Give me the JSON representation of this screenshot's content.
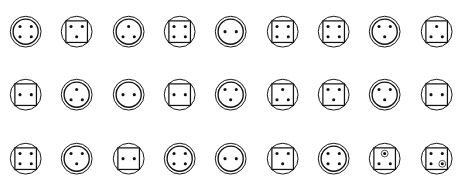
{
  "figure": {
    "rows": 3,
    "columns": 9,
    "stroke_color": "#111111",
    "dot_color": "#111111",
    "background_color": "#ffffff"
  },
  "glyphs": [
    {
      "id": "r1c1",
      "row": 1,
      "col": 1,
      "frame": "double-circle",
      "dot_count": 4,
      "dot_layout": "four-corners",
      "dots": [
        {
          "x": -1,
          "y": -1,
          "ringed": false
        },
        {
          "x": 1,
          "y": -1,
          "ringed": false
        },
        {
          "x": -1,
          "y": 1,
          "ringed": false
        },
        {
          "x": 1,
          "y": 1,
          "ringed": false
        }
      ]
    },
    {
      "id": "r1c2",
      "row": 1,
      "col": 2,
      "frame": "circle-square",
      "dot_count": 3,
      "dot_layout": "two-top-one-bottom-center",
      "dots": [
        {
          "x": -1,
          "y": -1,
          "ringed": false
        },
        {
          "x": 1,
          "y": -1,
          "ringed": false
        },
        {
          "x": 0,
          "y": 1,
          "ringed": false
        }
      ]
    },
    {
      "id": "r1c3",
      "row": 1,
      "col": 3,
      "frame": "double-circle",
      "dot_count": 3,
      "dot_layout": "one-top-center-two-bottom",
      "dots": [
        {
          "x": 0,
          "y": -1,
          "ringed": false
        },
        {
          "x": -1,
          "y": 1,
          "ringed": false
        },
        {
          "x": 1,
          "y": 1,
          "ringed": false
        }
      ]
    },
    {
      "id": "r1c4",
      "row": 1,
      "col": 4,
      "frame": "circle-square",
      "dot_count": 4,
      "dot_layout": "four-corners",
      "dots": [
        {
          "x": -1,
          "y": -1,
          "ringed": false
        },
        {
          "x": 1,
          "y": -1,
          "ringed": false
        },
        {
          "x": -1,
          "y": 1,
          "ringed": false
        },
        {
          "x": 1,
          "y": 1,
          "ringed": false
        }
      ]
    },
    {
      "id": "r1c5",
      "row": 1,
      "col": 5,
      "frame": "double-circle",
      "dot_count": 2,
      "dot_layout": "two-horizontal-center",
      "dots": [
        {
          "x": -1,
          "y": 0,
          "ringed": false
        },
        {
          "x": 1,
          "y": 0,
          "ringed": false
        }
      ]
    },
    {
      "id": "r1c6",
      "row": 1,
      "col": 6,
      "frame": "circle-square",
      "dot_count": 4,
      "dot_layout": "four-corners",
      "dots": [
        {
          "x": -1,
          "y": -1,
          "ringed": false
        },
        {
          "x": 1,
          "y": -1,
          "ringed": false
        },
        {
          "x": -1,
          "y": 1,
          "ringed": false
        },
        {
          "x": 1,
          "y": 1,
          "ringed": false
        }
      ]
    },
    {
      "id": "r1c7",
      "row": 1,
      "col": 7,
      "frame": "circle-square",
      "dot_count": 4,
      "dot_layout": "four-corners",
      "dots": [
        {
          "x": -1,
          "y": -1,
          "ringed": false
        },
        {
          "x": 1,
          "y": -1,
          "ringed": false
        },
        {
          "x": -1,
          "y": 1,
          "ringed": false
        },
        {
          "x": 1,
          "y": 1,
          "ringed": false
        }
      ]
    },
    {
      "id": "r1c8",
      "row": 1,
      "col": 8,
      "frame": "double-circle",
      "dot_count": 3,
      "dot_layout": "two-top-one-bottom-center",
      "dots": [
        {
          "x": -1,
          "y": -1,
          "ringed": false
        },
        {
          "x": 1,
          "y": -1,
          "ringed": false
        },
        {
          "x": 0,
          "y": 1,
          "ringed": false
        }
      ]
    },
    {
      "id": "r1c9",
      "row": 1,
      "col": 9,
      "frame": "circle-square",
      "dot_count": 3,
      "dot_layout": "one-top-center-two-bottom",
      "dots": [
        {
          "x": 0,
          "y": -1,
          "ringed": false
        },
        {
          "x": -1,
          "y": 1,
          "ringed": false
        },
        {
          "x": 1,
          "y": 1,
          "ringed": false
        }
      ]
    },
    {
      "id": "r2c1",
      "row": 2,
      "col": 1,
      "frame": "circle-square",
      "dot_count": 2,
      "dot_layout": "two-horizontal-center",
      "dots": [
        {
          "x": -1,
          "y": 0,
          "ringed": false
        },
        {
          "x": 1,
          "y": 0,
          "ringed": false
        }
      ]
    },
    {
      "id": "r2c2",
      "row": 2,
      "col": 2,
      "frame": "double-circle",
      "dot_count": 3,
      "dot_layout": "one-top-center-two-bottom",
      "dots": [
        {
          "x": 0,
          "y": -1,
          "ringed": false
        },
        {
          "x": -1,
          "y": 1,
          "ringed": false
        },
        {
          "x": 1,
          "y": 1,
          "ringed": false
        }
      ]
    },
    {
      "id": "r2c3",
      "row": 2,
      "col": 3,
      "frame": "double-circle",
      "dot_count": 2,
      "dot_layout": "two-horizontal-center",
      "dots": [
        {
          "x": -1,
          "y": 0,
          "ringed": false
        },
        {
          "x": 1,
          "y": 0,
          "ringed": false
        }
      ]
    },
    {
      "id": "r2c4",
      "row": 2,
      "col": 4,
      "frame": "circle-square",
      "dot_count": 2,
      "dot_layout": "two-horizontal-center",
      "dots": [
        {
          "x": -1,
          "y": 0,
          "ringed": false
        },
        {
          "x": 1,
          "y": 0,
          "ringed": false
        }
      ]
    },
    {
      "id": "r2c5",
      "row": 2,
      "col": 5,
      "frame": "double-circle",
      "dot_count": 3,
      "dot_layout": "two-top-one-bottom-center",
      "dots": [
        {
          "x": -1,
          "y": -1,
          "ringed": false
        },
        {
          "x": 1,
          "y": -1,
          "ringed": false
        },
        {
          "x": 0,
          "y": 1,
          "ringed": false
        }
      ]
    },
    {
      "id": "r2c6",
      "row": 2,
      "col": 6,
      "frame": "circle-square",
      "dot_count": 3,
      "dot_layout": "one-top-center-two-bottom",
      "dots": [
        {
          "x": 0,
          "y": -1,
          "ringed": false
        },
        {
          "x": -1,
          "y": 1,
          "ringed": false
        },
        {
          "x": 1,
          "y": 1,
          "ringed": false
        }
      ]
    },
    {
      "id": "r2c7",
      "row": 2,
      "col": 7,
      "frame": "circle-square",
      "dot_count": 3,
      "dot_layout": "two-top-one-bottom-center",
      "dots": [
        {
          "x": -1,
          "y": -1,
          "ringed": false
        },
        {
          "x": 1,
          "y": -1,
          "ringed": false
        },
        {
          "x": 0,
          "y": 1,
          "ringed": false
        }
      ]
    },
    {
      "id": "r2c8",
      "row": 2,
      "col": 8,
      "frame": "double-circle",
      "dot_count": 3,
      "dot_layout": "two-top-one-bottom-center",
      "dots": [
        {
          "x": -1,
          "y": -1,
          "ringed": false
        },
        {
          "x": 1,
          "y": -1,
          "ringed": false
        },
        {
          "x": 0,
          "y": 1,
          "ringed": false
        }
      ]
    },
    {
      "id": "r2c9",
      "row": 2,
      "col": 9,
      "frame": "circle-square",
      "dot_count": 2,
      "dot_layout": "two-horizontal-center",
      "dots": [
        {
          "x": -1,
          "y": 0,
          "ringed": false
        },
        {
          "x": 1,
          "y": 0,
          "ringed": false
        }
      ]
    },
    {
      "id": "r3c1",
      "row": 3,
      "col": 1,
      "frame": "circle-square",
      "dot_count": 4,
      "dot_layout": "four-corners",
      "dots": [
        {
          "x": -1,
          "y": -1,
          "ringed": false
        },
        {
          "x": 1,
          "y": -1,
          "ringed": false
        },
        {
          "x": -1,
          "y": 1,
          "ringed": false
        },
        {
          "x": 1,
          "y": 1,
          "ringed": false
        }
      ]
    },
    {
      "id": "r3c2",
      "row": 3,
      "col": 2,
      "frame": "double-circle",
      "dot_count": 3,
      "dot_layout": "two-top-one-bottom-center",
      "dots": [
        {
          "x": -1,
          "y": -1,
          "ringed": false
        },
        {
          "x": 1,
          "y": -1,
          "ringed": false
        },
        {
          "x": 0,
          "y": 1,
          "ringed": false
        }
      ]
    },
    {
      "id": "r3c3",
      "row": 3,
      "col": 3,
      "frame": "circle-square",
      "dot_count": 2,
      "dot_layout": "two-horizontal-center",
      "dots": [
        {
          "x": -1,
          "y": 0,
          "ringed": false
        },
        {
          "x": 1,
          "y": 0,
          "ringed": false
        }
      ]
    },
    {
      "id": "r3c4",
      "row": 3,
      "col": 4,
      "frame": "double-circle",
      "dot_count": 4,
      "dot_layout": "four-corners",
      "dots": [
        {
          "x": -1,
          "y": -1,
          "ringed": false
        },
        {
          "x": 1,
          "y": -1,
          "ringed": false
        },
        {
          "x": -1,
          "y": 1,
          "ringed": false
        },
        {
          "x": 1,
          "y": 1,
          "ringed": false
        }
      ]
    },
    {
      "id": "r3c5",
      "row": 3,
      "col": 5,
      "frame": "double-circle",
      "dot_count": 2,
      "dot_layout": "two-horizontal-center",
      "dots": [
        {
          "x": -1,
          "y": 0,
          "ringed": false
        },
        {
          "x": 1,
          "y": 0,
          "ringed": false
        }
      ]
    },
    {
      "id": "r3c6",
      "row": 3,
      "col": 6,
      "frame": "circle-square",
      "dot_count": 3,
      "dot_layout": "two-top-one-bottom-center",
      "dots": [
        {
          "x": -1,
          "y": -1,
          "ringed": false
        },
        {
          "x": 1,
          "y": -1,
          "ringed": false
        },
        {
          "x": 0,
          "y": 1,
          "ringed": false
        }
      ]
    },
    {
      "id": "r3c7",
      "row": 3,
      "col": 7,
      "frame": "double-circle",
      "dot_count": 4,
      "dot_layout": "four-corners",
      "dots": [
        {
          "x": -1,
          "y": -1,
          "ringed": false
        },
        {
          "x": 1,
          "y": -1,
          "ringed": false
        },
        {
          "x": -1,
          "y": 1,
          "ringed": false
        },
        {
          "x": 1,
          "y": 1,
          "ringed": false
        }
      ]
    },
    {
      "id": "r3c8",
      "row": 3,
      "col": 8,
      "frame": "circle-square",
      "dot_count": 3,
      "dot_layout": "one-top-center-two-bottom",
      "dots": [
        {
          "x": 0,
          "y": -1,
          "ringed": true
        },
        {
          "x": -1,
          "y": 1,
          "ringed": false
        },
        {
          "x": 1,
          "y": 1,
          "ringed": false
        }
      ]
    },
    {
      "id": "r3c9",
      "row": 3,
      "col": 9,
      "frame": "circle-square",
      "dot_count": 4,
      "dot_layout": "four-corners",
      "dots": [
        {
          "x": -1,
          "y": -1,
          "ringed": false
        },
        {
          "x": 1,
          "y": -1,
          "ringed": false
        },
        {
          "x": -1,
          "y": 1,
          "ringed": false
        },
        {
          "x": 1,
          "y": 1,
          "ringed": true
        }
      ]
    }
  ]
}
